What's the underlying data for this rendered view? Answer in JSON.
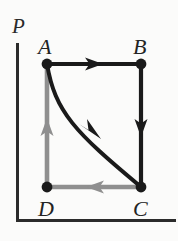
{
  "figure": {
    "kind": "pv-cycle-diagram",
    "background_color": "#fbfbfa",
    "width": 178,
    "height": 241
  },
  "axes": {
    "vertical_label": "P",
    "horizontal_label": "",
    "color": "#2b2b2b",
    "origin": {
      "x": 16,
      "y": 222
    },
    "vertical_top_y": 43,
    "horizontal_right_x": 176
  },
  "vertices": [
    {
      "id": "A",
      "label": "A",
      "x": 47,
      "y": 64,
      "label_x": 38,
      "label_y": 54
    },
    {
      "id": "B",
      "label": "B",
      "x": 141,
      "y": 64,
      "label_x": 133,
      "label_y": 54
    },
    {
      "id": "C",
      "label": "C",
      "x": 141,
      "y": 187,
      "label_x": 133,
      "label_y": 216
    },
    {
      "id": "D",
      "label": "D",
      "x": 47,
      "y": 187,
      "label_x": 38,
      "label_y": 216
    }
  ],
  "vertex_dot": {
    "radius": 5.4,
    "color": "#1a1a1a"
  },
  "paths": [
    {
      "id": "A-to-B",
      "from": "A",
      "to": "B",
      "shape": "straight",
      "direction": "right",
      "color": "#1a1a1a",
      "width": 4.2,
      "arrow_at": {
        "x": 94,
        "y": 64
      }
    },
    {
      "id": "B-to-C",
      "from": "B",
      "to": "C",
      "shape": "straight",
      "direction": "down",
      "color": "#1a1a1a",
      "width": 4.2,
      "arrow_at": {
        "x": 141,
        "y": 128
      }
    },
    {
      "id": "C-to-D",
      "from": "C",
      "to": "D",
      "shape": "straight",
      "direction": "left",
      "color": "#8f8f8f",
      "width": 4.6,
      "arrow_at": {
        "x": 96,
        "y": 187
      }
    },
    {
      "id": "D-to-A",
      "from": "D",
      "to": "A",
      "shape": "straight",
      "direction": "up",
      "color": "#8f8f8f",
      "width": 4.6,
      "arrow_at": {
        "x": 47,
        "y": 128
      }
    },
    {
      "id": "A-to-C-curve",
      "from": "A",
      "to": "C",
      "shape": "curve",
      "direction": "down-right",
      "color": "#1a1a1a",
      "width": 4.0,
      "arrow_at": {
        "x": 91,
        "y": 131
      }
    }
  ]
}
